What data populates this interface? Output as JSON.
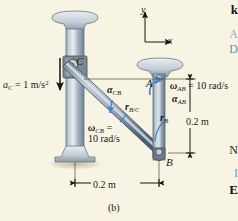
{
  "figure": {
    "caption": "(b)",
    "background_color": "#f7f4e4",
    "type": "mechanism-kinematics-diagram"
  },
  "axes": {
    "x_label": "x",
    "y_label": "y"
  },
  "points": {
    "c": "C",
    "a": "A",
    "b": "B"
  },
  "labels": {
    "a_c": "a",
    "a_c_sub": "C",
    "a_c_value": " = 1 m/s",
    "a_c_exp": "2",
    "alpha_cb": "α",
    "alpha_cb_sub": "CB",
    "r_bc": "r",
    "r_bc_sub": "B/C",
    "omega_cb": "ω",
    "omega_cb_sub": "CB",
    "omega_cb_eq": " =",
    "omega_cb_value": "10 rad/s",
    "omega_ab": "ω",
    "omega_ab_sub": "AB",
    "omega_ab_value": " = 10 rad/s",
    "alpha_ab": "α",
    "alpha_ab_sub": "AB",
    "r_b": "r",
    "r_b_sub": "B"
  },
  "dimensions": {
    "vertical": "0.2 m",
    "horizontal": "0.2 m"
  },
  "edge_text": {
    "k": "k",
    "a": "A",
    "d": "D",
    "n": "N",
    "i": "I",
    "e": "E"
  },
  "colors": {
    "background": "#f7f4e4",
    "bar_steel": "#8fa2b4",
    "bar_steel_dark": "#4c5f72",
    "bar_highlight": "#d6dee6",
    "collar_gray": "#6d7480",
    "arrow_blue": "#4a86c8",
    "ink": "#1a1a14"
  }
}
